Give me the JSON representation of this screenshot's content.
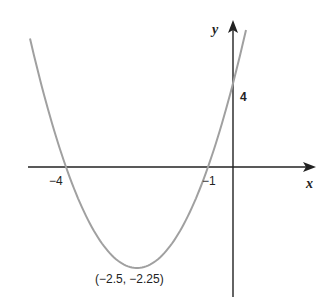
{
  "chart_data": {
    "type": "line",
    "title": "",
    "function": "y = x^2 + 5x + 4",
    "xlabel": "x",
    "ylabel": "y",
    "x_intercepts": [
      -4,
      -1
    ],
    "y_intercept": 4,
    "vertex": [
      -2.5,
      -2.25
    ],
    "tick_labels": {
      "x": [
        "-4",
        "-1"
      ],
      "y": [
        "4"
      ]
    },
    "grid": false,
    "colors": {
      "curve": "#a0a0a0",
      "axes": "#222222"
    }
  },
  "labels": {
    "x_axis": "x",
    "y_axis": "y",
    "x_root_left": "−4",
    "x_root_right": "−1",
    "y_intercept": "4",
    "vertex": "(−2.5, −2.25)"
  }
}
